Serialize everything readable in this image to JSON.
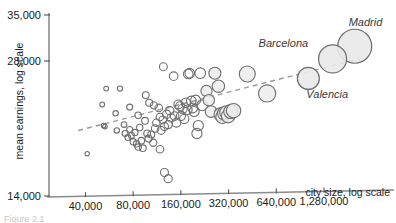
{
  "chart_data": {
    "type": "scatter",
    "title": "",
    "xlabel": "city size, log scale",
    "ylabel": "mean earnings, log scale",
    "x_scale": "log",
    "y_scale": "log",
    "grid": false,
    "legend": null,
    "xticks": [
      "40,000",
      "80,000",
      "160,000",
      "320,000",
      "640,000",
      "1,280,000"
    ],
    "xtick_values": [
      40000,
      80000,
      160000,
      320000,
      640000,
      1280000
    ],
    "yticks": [
      "14,000",
      "28,000",
      "35,000"
    ],
    "ytick_values": [
      14000,
      28000,
      35000
    ],
    "xlim": [
      32000,
      2400000
    ],
    "ylim": [
      14000,
      35000
    ],
    "marker": "open-circle",
    "marker_size_encodes": "city size",
    "trendline": {
      "present": true,
      "style": "dashed",
      "color": "#9a9a9a",
      "x_start": 36000,
      "y_start": 19600,
      "x_end": 2200000,
      "y_end": 28400
    },
    "annotations": [
      {
        "label": "Madrid",
        "x": 2000000,
        "y": 30200,
        "r": 17
      },
      {
        "label": "Barcelona",
        "x": 1450000,
        "y": 28300,
        "r": 14
      },
      {
        "label": "Valencia",
        "x": 1020000,
        "y": 25600,
        "r": 11
      }
    ],
    "points": [
      {
        "x": 41000,
        "y": 17400,
        "r": 2.2
      },
      {
        "x": 54000,
        "y": 24300,
        "r": 2.4
      },
      {
        "x": 51000,
        "y": 22400,
        "r": 2.4
      },
      {
        "x": 66000,
        "y": 24300,
        "r": 2.6
      },
      {
        "x": 52000,
        "y": 20100,
        "r": 2.3
      },
      {
        "x": 53000,
        "y": 20000,
        "r": 2.3
      },
      {
        "x": 62000,
        "y": 21400,
        "r": 2.7
      },
      {
        "x": 63000,
        "y": 19600,
        "r": 2.7
      },
      {
        "x": 70000,
        "y": 20200,
        "r": 2.8
      },
      {
        "x": 71000,
        "y": 19300,
        "r": 2.9
      },
      {
        "x": 74000,
        "y": 18900,
        "r": 2.9
      },
      {
        "x": 76000,
        "y": 19700,
        "r": 3.0
      },
      {
        "x": 78000,
        "y": 19100,
        "r": 3.0
      },
      {
        "x": 80000,
        "y": 18500,
        "r": 3.1
      },
      {
        "x": 82000,
        "y": 19400,
        "r": 3.1
      },
      {
        "x": 84000,
        "y": 18300,
        "r": 3.2
      },
      {
        "x": 86000,
        "y": 18000,
        "r": 3.2
      },
      {
        "x": 88000,
        "y": 19900,
        "r": 3.2
      },
      {
        "x": 90000,
        "y": 18600,
        "r": 3.3
      },
      {
        "x": 92000,
        "y": 17900,
        "r": 3.3
      },
      {
        "x": 76000,
        "y": 22100,
        "r": 3.0
      },
      {
        "x": 86000,
        "y": 21200,
        "r": 3.2
      },
      {
        "x": 95000,
        "y": 20600,
        "r": 3.4
      },
      {
        "x": 98000,
        "y": 19300,
        "r": 3.4
      },
      {
        "x": 100000,
        "y": 18800,
        "r": 3.5
      },
      {
        "x": 104000,
        "y": 19200,
        "r": 3.5
      },
      {
        "x": 107000,
        "y": 18400,
        "r": 3.6
      },
      {
        "x": 110000,
        "y": 19800,
        "r": 3.7
      },
      {
        "x": 112000,
        "y": 20400,
        "r": 3.7
      },
      {
        "x": 96000,
        "y": 23500,
        "r": 3.4
      },
      {
        "x": 101000,
        "y": 22600,
        "r": 3.5
      },
      {
        "x": 108000,
        "y": 22300,
        "r": 3.6
      },
      {
        "x": 116000,
        "y": 22000,
        "r": 3.8
      },
      {
        "x": 118000,
        "y": 21000,
        "r": 3.8
      },
      {
        "x": 120000,
        "y": 19600,
        "r": 3.9
      },
      {
        "x": 123000,
        "y": 20700,
        "r": 3.9
      },
      {
        "x": 126000,
        "y": 20000,
        "r": 4.0
      },
      {
        "x": 130000,
        "y": 21300,
        "r": 4.1
      },
      {
        "x": 133000,
        "y": 20200,
        "r": 4.1
      },
      {
        "x": 136000,
        "y": 21700,
        "r": 4.2
      },
      {
        "x": 139000,
        "y": 20900,
        "r": 4.2
      },
      {
        "x": 124000,
        "y": 27200,
        "r": 3.9
      },
      {
        "x": 118000,
        "y": 17800,
        "r": 3.8
      },
      {
        "x": 126000,
        "y": 15800,
        "r": 4.0
      },
      {
        "x": 133000,
        "y": 15300,
        "r": 4.1
      },
      {
        "x": 144000,
        "y": 25900,
        "r": 4.3
      },
      {
        "x": 146000,
        "y": 21100,
        "r": 4.3
      },
      {
        "x": 150000,
        "y": 20400,
        "r": 4.4
      },
      {
        "x": 154000,
        "y": 22400,
        "r": 4.4
      },
      {
        "x": 158000,
        "y": 22200,
        "r": 4.5
      },
      {
        "x": 160000,
        "y": 21100,
        "r": 4.5
      },
      {
        "x": 164000,
        "y": 21900,
        "r": 4.6
      },
      {
        "x": 168000,
        "y": 20800,
        "r": 4.6
      },
      {
        "x": 172000,
        "y": 22600,
        "r": 4.7
      },
      {
        "x": 176000,
        "y": 21800,
        "r": 4.7
      },
      {
        "x": 178000,
        "y": 26200,
        "r": 4.8
      },
      {
        "x": 182000,
        "y": 26300,
        "r": 4.8
      },
      {
        "x": 186000,
        "y": 22800,
        "r": 4.9
      },
      {
        "x": 190000,
        "y": 22000,
        "r": 4.9
      },
      {
        "x": 194000,
        "y": 21600,
        "r": 5.0
      },
      {
        "x": 198000,
        "y": 22900,
        "r": 5.0
      },
      {
        "x": 202000,
        "y": 19300,
        "r": 5.1
      },
      {
        "x": 206000,
        "y": 20100,
        "r": 5.1
      },
      {
        "x": 212000,
        "y": 26300,
        "r": 5.3
      },
      {
        "x": 218000,
        "y": 22300,
        "r": 5.4
      },
      {
        "x": 232000,
        "y": 24000,
        "r": 5.6
      },
      {
        "x": 240000,
        "y": 22900,
        "r": 5.7
      },
      {
        "x": 248000,
        "y": 21600,
        "r": 5.8
      },
      {
        "x": 262000,
        "y": 26300,
        "r": 6.0
      },
      {
        "x": 276000,
        "y": 24600,
        "r": 6.2
      },
      {
        "x": 284000,
        "y": 21300,
        "r": 6.4
      },
      {
        "x": 292000,
        "y": 21000,
        "r": 6.5
      },
      {
        "x": 300000,
        "y": 21400,
        "r": 6.6
      },
      {
        "x": 310000,
        "y": 21500,
        "r": 6.7
      },
      {
        "x": 318000,
        "y": 21100,
        "r": 6.8
      },
      {
        "x": 330000,
        "y": 21600,
        "r": 7.0
      },
      {
        "x": 344000,
        "y": 21700,
        "r": 7.2
      },
      {
        "x": 420000,
        "y": 26200,
        "r": 8.0
      },
      {
        "x": 560000,
        "y": 23700,
        "r": 8.6
      }
    ]
  },
  "caption": {
    "text": "Figure 2.1"
  }
}
